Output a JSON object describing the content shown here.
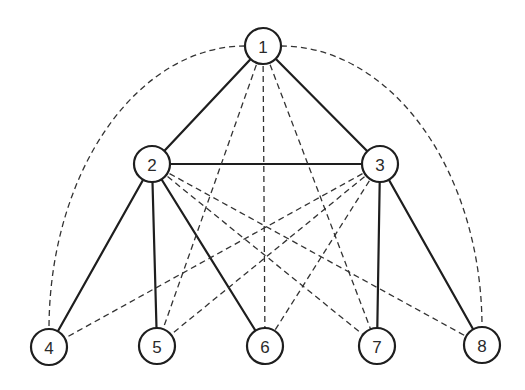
{
  "diagram": {
    "type": "graph",
    "colors": {
      "background": "#ffffff",
      "stroke": "#1e1e1e",
      "dashed_stroke": "#333333",
      "label": "#2a2a2a"
    },
    "node_radius": 18,
    "nodes": [
      {
        "id": "1",
        "label": "1",
        "x": 263,
        "y": 46
      },
      {
        "id": "2",
        "label": "2",
        "x": 152,
        "y": 164
      },
      {
        "id": "3",
        "label": "3",
        "x": 380,
        "y": 164
      },
      {
        "id": "4",
        "label": "4",
        "x": 49,
        "y": 347
      },
      {
        "id": "5",
        "label": "5",
        "x": 157,
        "y": 346
      },
      {
        "id": "6",
        "label": "6",
        "x": 265,
        "y": 346
      },
      {
        "id": "7",
        "label": "7",
        "x": 377,
        "y": 346
      },
      {
        "id": "8",
        "label": "8",
        "x": 482,
        "y": 345
      }
    ],
    "edges": [
      {
        "from": "1",
        "to": "2",
        "style": "solid"
      },
      {
        "from": "1",
        "to": "3",
        "style": "solid"
      },
      {
        "from": "2",
        "to": "3",
        "style": "solid"
      },
      {
        "from": "2",
        "to": "4",
        "style": "solid"
      },
      {
        "from": "2",
        "to": "5",
        "style": "solid"
      },
      {
        "from": "2",
        "to": "6",
        "style": "solid"
      },
      {
        "from": "3",
        "to": "7",
        "style": "solid"
      },
      {
        "from": "3",
        "to": "8",
        "style": "solid"
      },
      {
        "from": "1",
        "to": "5",
        "style": "dashed"
      },
      {
        "from": "1",
        "to": "6",
        "style": "dashed"
      },
      {
        "from": "1",
        "to": "7",
        "style": "dashed"
      },
      {
        "from": "2",
        "to": "7",
        "style": "dashed"
      },
      {
        "from": "2",
        "to": "8",
        "style": "dashed"
      },
      {
        "from": "3",
        "to": "4",
        "style": "dashed"
      },
      {
        "from": "3",
        "to": "5",
        "style": "dashed"
      },
      {
        "from": "3",
        "to": "6",
        "style": "dashed"
      },
      {
        "from": "1",
        "to": "4",
        "style": "dashed",
        "shape": "arc"
      },
      {
        "from": "1",
        "to": "8",
        "style": "dashed",
        "shape": "arc"
      }
    ]
  }
}
